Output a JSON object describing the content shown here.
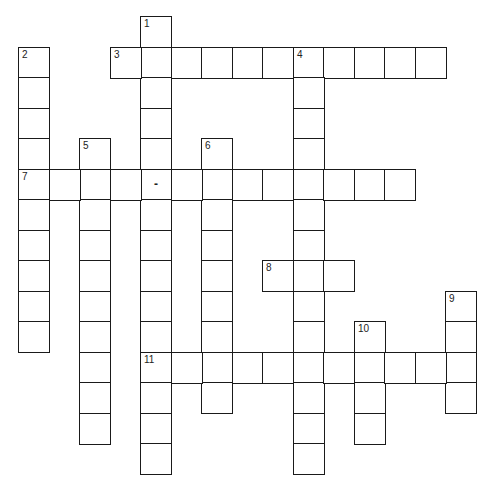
{
  "puzzle": {
    "type": "crossword",
    "cell_size": 30.5,
    "origin": {
      "x": 18,
      "y": 16
    },
    "entries": [
      {
        "number": 1,
        "direction": "down",
        "row": 0,
        "col": 4,
        "length": 15
      },
      {
        "number": 2,
        "direction": "down",
        "row": 1,
        "col": 0,
        "length": 10
      },
      {
        "number": 3,
        "direction": "across",
        "row": 1,
        "col": 3,
        "length": 11
      },
      {
        "number": 4,
        "direction": "down",
        "row": 1,
        "col": 9,
        "length": 14
      },
      {
        "number": 5,
        "direction": "down",
        "row": 4,
        "col": 2,
        "length": 10
      },
      {
        "number": 6,
        "direction": "down",
        "row": 4,
        "col": 6,
        "length": 9
      },
      {
        "number": 7,
        "direction": "across",
        "row": 5,
        "col": 0,
        "length": 13,
        "hyphen_at_index": 4
      },
      {
        "number": 8,
        "direction": "across",
        "row": 8,
        "col": 8,
        "length": 3
      },
      {
        "number": 9,
        "direction": "down",
        "row": 9,
        "col": 14,
        "length": 4
      },
      {
        "number": 10,
        "direction": "down",
        "row": 10,
        "col": 11,
        "length": 4
      },
      {
        "number": 11,
        "direction": "across",
        "row": 11,
        "col": 4,
        "length": 11
      }
    ],
    "hyphen_glyph": "-"
  }
}
